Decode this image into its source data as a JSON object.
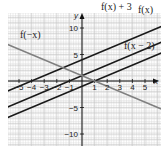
{
  "chart_data": {
    "type": "line",
    "title": "",
    "xlabel": "x",
    "ylabel": "y",
    "xlim": [
      -6,
      6
    ],
    "ylim": [
      -12,
      13
    ],
    "grid": true,
    "x_ticks": [
      "-5",
      "-4",
      "-3",
      "-2",
      "-1",
      "1",
      "2",
      "3",
      "4",
      "5"
    ],
    "y_ticks": [
      "10",
      "5",
      "-5",
      "-10"
    ],
    "series": [
      {
        "name": "f(x) + 3",
        "equation": "y = x + 4",
        "color": "#1a1a1a"
      },
      {
        "name": "f(x)",
        "equation": "y = x + 1",
        "color": "#1a1a1a"
      },
      {
        "name": "f(x − 2)",
        "equation": "y = x - 1",
        "color": "#1a1a1a"
      },
      {
        "name": "f(−x)",
        "equation": "y = -x + 1",
        "color": "#777777"
      }
    ]
  },
  "labels": {
    "fx_plus3": "f(x) + 3",
    "fx": "f(x)",
    "fx_minus2": "f(x − 2)",
    "f_negx": "f(−x)",
    "x_axis": "x",
    "y_axis": "y",
    "x_ticks": [
      {
        "text": "−5",
        "v": -5
      },
      {
        "text": "−4",
        "v": -4
      },
      {
        "text": "−3",
        "v": -3
      },
      {
        "text": "−2",
        "v": -2
      },
      {
        "text": "−1",
        "v": -1
      },
      {
        "text": "1",
        "v": 1
      },
      {
        "text": "2",
        "v": 2
      },
      {
        "text": "3",
        "v": 3
      },
      {
        "text": "4",
        "v": 4
      },
      {
        "text": "5",
        "v": 5
      }
    ],
    "y_ticks": [
      {
        "text": "10",
        "v": 10
      },
      {
        "text": "5",
        "v": 5
      },
      {
        "text": "−5",
        "v": -5
      },
      {
        "text": "−10",
        "v": -10
      }
    ]
  }
}
